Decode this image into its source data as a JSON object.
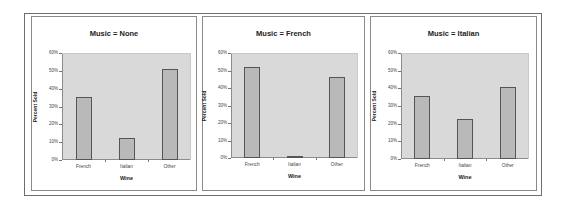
{
  "chart_data": [
    {
      "type": "bar",
      "title": "Music = None",
      "categories": [
        "French",
        "Italian",
        "Other"
      ],
      "values": [
        35.5,
        12.5,
        51
      ],
      "xlabel": "Wine",
      "ylabel": "Percent Sold",
      "ylim": [
        0,
        60
      ],
      "yticks": [
        "0%",
        "10%",
        "20%",
        "30%",
        "40%",
        "50%",
        "60%"
      ],
      "grid": false,
      "legend": "none"
    },
    {
      "type": "bar",
      "title": "Music = French",
      "categories": [
        "French",
        "Italian",
        "Other"
      ],
      "values": [
        52,
        1,
        46.5
      ],
      "xlabel": "Wine",
      "ylabel": "Percent Sold",
      "ylim": [
        0,
        60
      ],
      "yticks": [
        "0%",
        "10%",
        "20%",
        "30%",
        "40%",
        "50%",
        "60%"
      ],
      "grid": false,
      "legend": "none"
    },
    {
      "type": "bar",
      "title": "Music = Italian",
      "categories": [
        "French",
        "Italian",
        "Other"
      ],
      "values": [
        35.5,
        22.5,
        41
      ],
      "xlabel": "Wine",
      "ylabel": "Percent Sold",
      "ylim": [
        0,
        60
      ],
      "yticks": [
        "0%",
        "10%",
        "20%",
        "30%",
        "40%",
        "50%",
        "60%"
      ],
      "grid": false,
      "legend": "none"
    }
  ],
  "colors": {
    "bar_fill": "#b9b9b9",
    "bar_border": "#555555",
    "plot_background": "#d9d9d9"
  }
}
